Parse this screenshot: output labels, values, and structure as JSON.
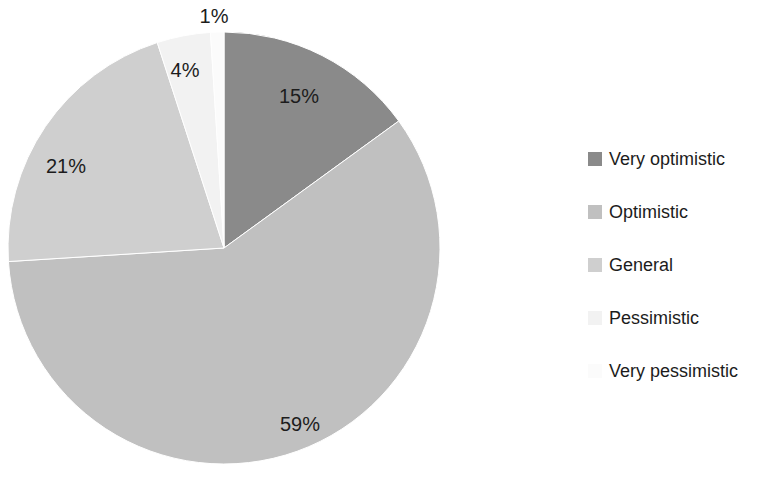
{
  "chart_data": {
    "type": "pie",
    "title": "",
    "subtitle": "",
    "xlabel": "",
    "ylabel": "",
    "grid": false,
    "legend_position": "right",
    "start_angle_deg": 0,
    "direction": "clockwise",
    "categories": [
      "Very optimistic",
      "Optimistic",
      "General",
      "Pessimistic",
      "Very pessimistic"
    ],
    "values": [
      15,
      59,
      21,
      4,
      1
    ],
    "value_labels": [
      "15%",
      "59%",
      "21%",
      "4%",
      "1%"
    ],
    "colors": [
      "#8a8a8a",
      "#c0c0c0",
      "#cfcfcf",
      "#f2f2f2",
      "#fbfbfb"
    ],
    "slices": [
      {
        "label": "Very optimistic",
        "value": 15,
        "value_label": "15%",
        "color": "#8a8a8a",
        "label_x": 299,
        "label_y": 96
      },
      {
        "label": "Optimistic",
        "value": 59,
        "value_label": "59%",
        "color": "#c0c0c0",
        "label_x": 300,
        "label_y": 424
      },
      {
        "label": "General",
        "value": 21,
        "value_label": "21%",
        "color": "#cfcfcf",
        "label_x": 66,
        "label_y": 166
      },
      {
        "label": "Pessimistic",
        "value": 4,
        "value_label": "4%",
        "color": "#f2f2f2",
        "label_x": 185,
        "label_y": 70
      },
      {
        "label": "Very pessimistic",
        "value": 1,
        "value_label": "1%",
        "color": "#fbfbfb",
        "label_x": 214,
        "label_y": 16
      }
    ],
    "geometry": {
      "cx": 224,
      "cy": 248,
      "r": 216
    }
  },
  "legend": {
    "items": [
      {
        "label": "Very optimistic",
        "color": "#8a8a8a"
      },
      {
        "label": "Optimistic",
        "color": "#c0c0c0"
      },
      {
        "label": "General",
        "color": "#cfcfcf"
      },
      {
        "label": "Pessimistic",
        "color": "#f2f2f2"
      },
      {
        "label": "Very pessimistic",
        "color": "#fbfbfb"
      }
    ]
  }
}
